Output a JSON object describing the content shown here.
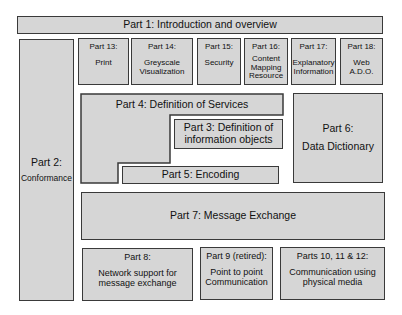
{
  "diagram": {
    "colors": {
      "fill": "#d6d6d6",
      "border": "#3a3a3a",
      "background": "#ffffff"
    },
    "part1": {
      "label": "Part 1: Introduction and overview"
    },
    "part2": {
      "title": "Part 2:",
      "subtitle": "Conformance"
    },
    "top_parts": [
      {
        "title": "Part 13:",
        "subtitle": "Print"
      },
      {
        "title": "Part 14:",
        "subtitle": "Greyscale Visualization"
      },
      {
        "title": "Part 15:",
        "subtitle": "Security"
      },
      {
        "title": "Part 16:",
        "subtitle": "Content Mapping Resource"
      },
      {
        "title": "Part 17:",
        "subtitle": "Explanatory Information"
      },
      {
        "title": "Part 18:",
        "subtitle": "Web A.D.O."
      }
    ],
    "part4": {
      "label": "Part 4: Definition of Services"
    },
    "part3": {
      "line1": "Part 3: Definition of",
      "line2": "information objects"
    },
    "part5": {
      "label": "Part 5: Encoding"
    },
    "part6": {
      "title": "Part 6:",
      "subtitle": "Data Dictionary"
    },
    "part7": {
      "label": "Part 7: Message Exchange"
    },
    "bottom_parts": [
      {
        "title": "Part 8:",
        "subtitle": "Network support for message exchange"
      },
      {
        "title": "Part 9 (retired):",
        "subtitle": "Point to point Communication"
      },
      {
        "title": "Parts 10, 11 & 12:",
        "subtitle": "Communication using physical media"
      }
    ]
  }
}
